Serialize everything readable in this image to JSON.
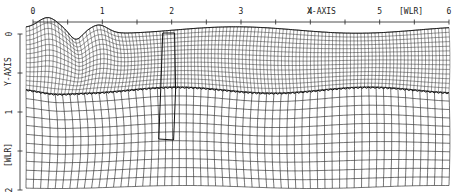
{
  "figure": {
    "x_axis": {
      "title": "X-AXIS",
      "unit": "[WLR]",
      "tick_labels": [
        "0",
        "1",
        "2",
        "3",
        "4",
        "5",
        "6"
      ],
      "range": [
        0,
        6
      ],
      "minor_step": 0.5
    },
    "y_axis": {
      "title": "Y-AXIS",
      "unit": "[WLR]",
      "tick_labels": [
        "0",
        "1",
        "2"
      ],
      "range": [
        0,
        2
      ],
      "minor_step": 0.5
    },
    "upper_layer": {
      "description": "dense deformed mesh with breaking wave near x≈0.5",
      "columns": 120,
      "rows": 14
    },
    "lower_layer": {
      "description": "coarser deformed mesh below interface",
      "columns": 58,
      "rows": 11
    },
    "highlighted_column": {
      "x_start": 1.9,
      "x_end": 2.1,
      "label": ""
    },
    "colors": {
      "line": "#1a1a1a",
      "background": "#ffffff"
    }
  }
}
